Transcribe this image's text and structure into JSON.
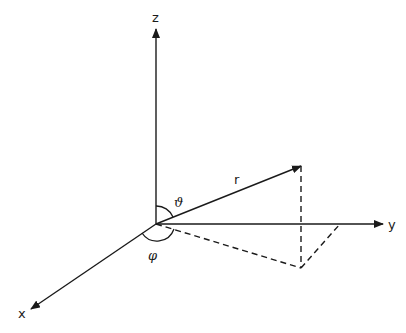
{
  "diagram": {
    "labels": {
      "z_axis": "z",
      "y_axis": "y",
      "x_axis": "x",
      "radius": "r",
      "polar_angle": "ϑ",
      "azimuth_angle": "φ"
    },
    "colors": {
      "stroke": "#1a1a1a",
      "background": "#ffffff"
    }
  }
}
